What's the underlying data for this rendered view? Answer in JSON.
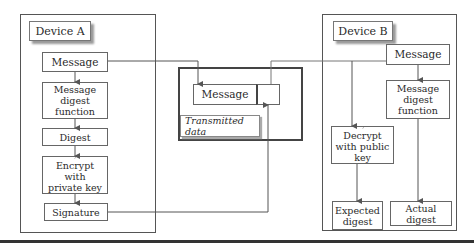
{
  "device_a": {
    "title": "Device A",
    "nodes": [
      {
        "id": "message",
        "label": "Message"
      },
      {
        "id": "digest_function",
        "label": "Message digest function"
      },
      {
        "id": "digest",
        "label": "Digest"
      },
      {
        "id": "encrypt",
        "label": "Encrypt with private key",
        "icon": "key-icon"
      },
      {
        "id": "signature",
        "label": "Signature"
      }
    ]
  },
  "transmitted": {
    "label": "Transmitted data",
    "message_label": "Message",
    "signature_slot_label": ""
  },
  "device_b": {
    "title": "Device B",
    "nodes": [
      {
        "id": "message",
        "label": "Message"
      },
      {
        "id": "digest_function",
        "label": "Message digest function"
      },
      {
        "id": "decrypt",
        "label": "Decrypt with public key",
        "icon": "key-icon"
      },
      {
        "id": "expected_digest",
        "label": "Expected digest"
      },
      {
        "id": "actual_digest",
        "label": "Actual digest"
      }
    ]
  },
  "colors": {
    "line": "#555555",
    "shadow": "#9a9a9a",
    "key": "#777777",
    "separator": "#333333"
  }
}
